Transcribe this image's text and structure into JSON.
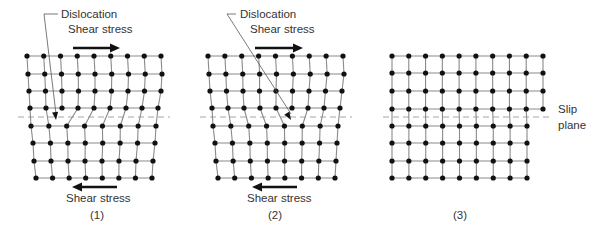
{
  "figure": {
    "panels": [
      {
        "id": "1",
        "caption": "(1)",
        "caption_pos": [
          97,
          219
        ],
        "dislocation_label": "Dislocation",
        "dislocation_label_pos": [
          61,
          17
        ],
        "leader": {
          "elbow": [
            44,
            14
          ],
          "text_start": [
            58,
            14
          ],
          "tip": [
            56,
            120
          ]
        },
        "top_shear_label": "Shear stress",
        "top_shear_label_pos": [
          68,
          33
        ],
        "top_arrow": {
          "x1": 73,
          "x2": 120,
          "y": 48,
          "direction": "right"
        },
        "bottom_shear_label": "Shear stress",
        "bottom_shear_label_pos": [
          66,
          202
        ],
        "bottom_arrow": {
          "x1": 117,
          "x2": 72,
          "y": 187,
          "direction": "left"
        },
        "slip_plane": {
          "x1": 18,
          "x2": 170,
          "y": 117
        },
        "top_rows": [
          {
            "y": 56,
            "x_start": 27,
            "x_end": 161,
            "count": 9
          },
          {
            "y": 74,
            "x_start": 28,
            "x_end": 162,
            "count": 9
          },
          {
            "y": 91,
            "x_start": 29,
            "x_end": 161,
            "count": 9
          },
          {
            "y": 108,
            "x_start": 30,
            "x_end": 158,
            "count": 9
          }
        ],
        "bottom_rows": [
          {
            "y": 126,
            "x_start": 31,
            "x_end": 156,
            "count": 8
          },
          {
            "y": 143,
            "x_start": 33,
            "x_end": 155,
            "count": 8
          },
          {
            "y": 161,
            "x_start": 34,
            "x_end": 153,
            "count": 8
          },
          {
            "y": 178,
            "x_start": 36,
            "x_end": 152,
            "count": 8
          }
        ],
        "extra_half_plane_column": 2
      },
      {
        "id": "2",
        "caption": "(2)",
        "caption_pos": [
          275,
          219
        ],
        "dislocation_label": "Dislocation",
        "dislocation_label_pos": [
          240,
          17
        ],
        "leader": {
          "elbow": [
            227,
            14
          ],
          "text_start": [
            236,
            14
          ],
          "tip": [
            291,
            120
          ]
        },
        "top_shear_label": "Shear stress",
        "top_shear_label_pos": [
          250,
          33
        ],
        "top_arrow": {
          "x1": 255,
          "x2": 303,
          "y": 48,
          "direction": "right"
        },
        "bottom_shear_label": "Shear stress",
        "bottom_shear_label_pos": [
          247,
          202
        ],
        "bottom_arrow": {
          "x1": 297,
          "x2": 252,
          "y": 187,
          "direction": "left"
        },
        "slip_plane": {
          "x1": 200,
          "x2": 352,
          "y": 117
        },
        "top_rows": [
          {
            "y": 56,
            "x_start": 208,
            "x_end": 343,
            "count": 9
          },
          {
            "y": 74,
            "x_start": 209,
            "x_end": 344,
            "count": 9
          },
          {
            "y": 91,
            "x_start": 210,
            "x_end": 342,
            "count": 9
          },
          {
            "y": 108,
            "x_start": 212,
            "x_end": 340,
            "count": 9
          }
        ],
        "bottom_rows": [
          {
            "y": 126,
            "x_start": 213,
            "x_end": 338,
            "count": 8
          },
          {
            "y": 143,
            "x_start": 215,
            "x_end": 337,
            "count": 8
          },
          {
            "y": 161,
            "x_start": 216,
            "x_end": 336,
            "count": 8
          },
          {
            "y": 178,
            "x_start": 218,
            "x_end": 335,
            "count": 8
          }
        ],
        "extra_half_plane_column": 5
      },
      {
        "id": "3",
        "caption": "(3)",
        "caption_pos": [
          460,
          219
        ],
        "slip_plane": {
          "x1": 383,
          "x2": 552,
          "y": 117
        },
        "slip_plane_label_line1": "Slip",
        "slip_plane_label_line2": "plane",
        "slip_label_pos": [
          558,
          113
        ],
        "top_rows": [
          {
            "y": 56,
            "x_start": 392,
            "x_end": 543,
            "count": 10
          },
          {
            "y": 73,
            "x_start": 392,
            "x_end": 543,
            "count": 10
          },
          {
            "y": 91,
            "x_start": 392,
            "x_end": 543,
            "count": 10
          },
          {
            "y": 109,
            "x_start": 392,
            "x_end": 543,
            "count": 10
          }
        ],
        "bottom_rows": [
          {
            "y": 126,
            "x_start": 392,
            "x_end": 527,
            "count": 9
          },
          {
            "y": 143,
            "x_start": 392,
            "x_end": 527,
            "count": 9
          },
          {
            "y": 161,
            "x_start": 392,
            "x_end": 527,
            "count": 9
          },
          {
            "y": 178,
            "x_start": 392,
            "x_end": 527,
            "count": 9
          }
        ],
        "extra_half_plane_column": 9
      }
    ]
  }
}
